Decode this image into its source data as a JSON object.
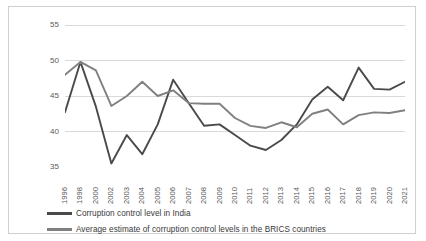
{
  "chart_data": {
    "type": "line",
    "title": "",
    "xlabel": "",
    "ylabel": "Corruption control level",
    "ylim": [
      35,
      55
    ],
    "yticks": [
      35,
      40,
      45,
      50,
      55
    ],
    "grid": true,
    "legend_position": "bottom",
    "categories": [
      "1996",
      "1998",
      "2000",
      "2002",
      "2003",
      "2004",
      "2005",
      "2006",
      "2007",
      "2008",
      "2009",
      "2010",
      "2011",
      "2012",
      "2013",
      "2014",
      "2015",
      "2016",
      "2017",
      "2018",
      "2019",
      "2020",
      "2021"
    ],
    "series": [
      {
        "name": "Corruption control level in India",
        "color": "#4a4a4a",
        "values": [
          42.7,
          49.8,
          43.5,
          35.5,
          39.5,
          36.8,
          41.0,
          47.3,
          44.0,
          40.8,
          41.0,
          39.5,
          38.0,
          37.4,
          38.8,
          41.0,
          44.5,
          46.3,
          44.4,
          49.0,
          46.0,
          45.9,
          47.0
        ]
      },
      {
        "name": "Average estimate of corruption control levels in the BRICS countries",
        "color": "#808080",
        "values": [
          48.0,
          49.8,
          48.6,
          43.6,
          45.0,
          47.0,
          45.0,
          45.8,
          44.0,
          43.9,
          43.9,
          41.9,
          40.8,
          40.5,
          41.3,
          40.6,
          42.5,
          43.1,
          41.0,
          42.3,
          42.7,
          42.6,
          43.0
        ]
      }
    ]
  },
  "yticks_labels": [
    "55",
    "50",
    "45",
    "40",
    "35"
  ],
  "legend": {
    "items": [
      {
        "label": "Corruption control level in India",
        "color": "#4a4a4a"
      },
      {
        "label": "Average estimate of corruption control levels in the BRICS countries",
        "color": "#808080"
      }
    ]
  }
}
